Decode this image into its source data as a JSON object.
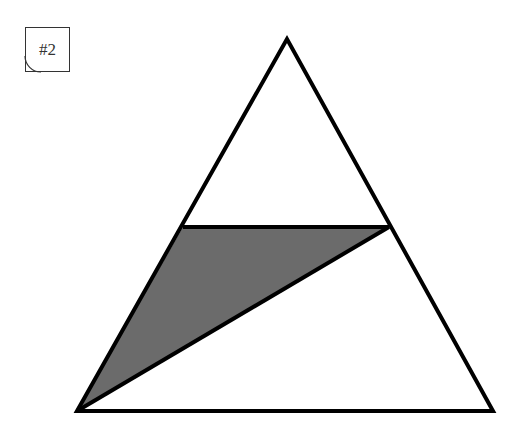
{
  "label": {
    "text": "#2"
  },
  "colors": {
    "stroke": "#000000",
    "shade": "#6b6b6b",
    "background": "#ffffff",
    "label_border": "#333333"
  },
  "diagram": {
    "outer_triangle": {
      "apex": [
        287,
        39
      ],
      "bottom_left": [
        77,
        411
      ],
      "bottom_right": [
        493,
        411
      ]
    },
    "horizontal_segment": {
      "left": [
        183,
        227
      ],
      "right": [
        389,
        227
      ]
    },
    "shaded_triangle": {
      "vertices": [
        [
          183,
          227
        ],
        [
          389,
          227
        ],
        [
          77,
          411
        ]
      ]
    },
    "diagonal_segment": {
      "from": [
        77,
        411
      ],
      "to": [
        389,
        227
      ]
    }
  }
}
